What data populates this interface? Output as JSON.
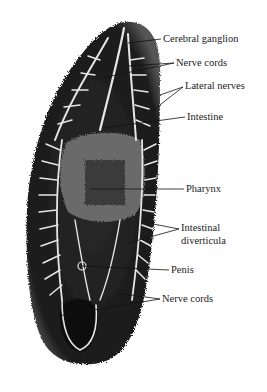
{
  "figure": {
    "labels": [
      {
        "id": "cerebral-ganglion",
        "text": "Cerebral ganglion",
        "x": 163,
        "y": 34
      },
      {
        "id": "nerve-cords-top",
        "text": "Nerve cords",
        "x": 176,
        "y": 58
      },
      {
        "id": "lateral-nerves",
        "text": "Lateral nerves",
        "x": 185,
        "y": 81
      },
      {
        "id": "intestine",
        "text": "Intestine",
        "x": 187,
        "y": 112
      },
      {
        "id": "pharynx",
        "text": "Pharynx",
        "x": 186,
        "y": 184
      },
      {
        "id": "intestinal-diverticula-1",
        "text": "Intestinal",
        "x": 181,
        "y": 223
      },
      {
        "id": "intestinal-diverticula-2",
        "text": "diverticula",
        "x": 181,
        "y": 236
      },
      {
        "id": "penis",
        "text": "Penis",
        "x": 171,
        "y": 265
      },
      {
        "id": "nerve-cords-bottom",
        "text": "Nerve cords",
        "x": 162,
        "y": 294
      }
    ],
    "colors": {
      "body": "#1a1a1a",
      "branches": "#e8e8e8",
      "pharynx": "#6a6a6a",
      "leader": "#111111"
    }
  }
}
